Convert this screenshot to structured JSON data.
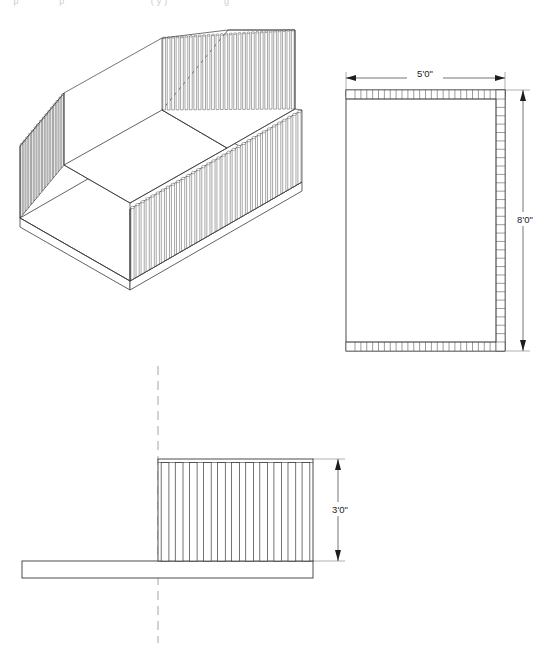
{
  "sheet": {
    "background_color": "#ffffff",
    "line_color": "#3a3a3a",
    "dim_color": "#222222",
    "partial_header_text": "     p               p                                ( y )                     g"
  },
  "views": {
    "isometric": {
      "name": "isometric-view",
      "description": "U-shaped slatted enclosure, three walls of vertical slats on a base",
      "wall_count": 3,
      "slats_long_wall": 34,
      "slats_short_wall": 22
    },
    "plan": {
      "name": "plan-view",
      "description": "Rectangular plan with slat cells along top, bottom and right edges",
      "slat_cells_horizontal": 24,
      "slat_cells_vertical": 29
    },
    "elevation": {
      "name": "elevation-view",
      "description": "Side elevation of slatted wall on a base ledge with centerline",
      "slat_count": 11,
      "has_centerline": true
    }
  },
  "dimensions": [
    {
      "id": "plan-width",
      "label": "5'0\"",
      "orientation": "horizontal"
    },
    {
      "id": "plan-depth",
      "label": "8'0\"",
      "orientation": "vertical"
    },
    {
      "id": "elev-height",
      "label": "3'0\"",
      "orientation": "vertical"
    }
  ]
}
